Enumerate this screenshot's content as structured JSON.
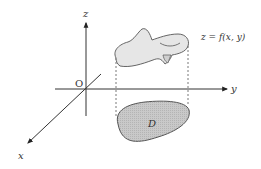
{
  "diagram": {
    "type": "3d-surface-over-region",
    "axes": {
      "z_label": "z",
      "y_label": "y",
      "x_label": "x",
      "origin_label": "O"
    },
    "surface": {
      "label": "z = f(x, y)",
      "fill_color": "#e6e6e6",
      "stroke_color": "#555555"
    },
    "region": {
      "label": "D",
      "fill_color": "#c8c8c8",
      "stroke_color": "#555555"
    },
    "projection_lines": {
      "style": "dashed",
      "color": "#555555"
    }
  }
}
